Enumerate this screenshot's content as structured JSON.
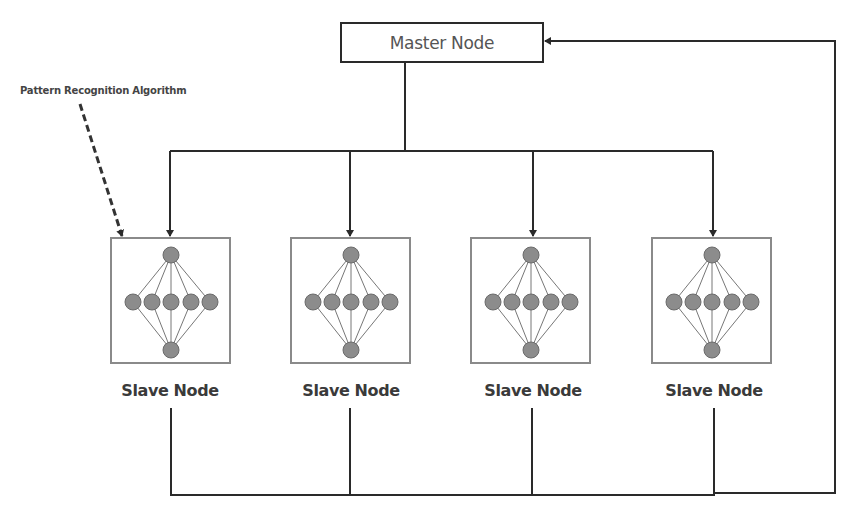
{
  "master": {
    "label": "Master Node"
  },
  "annotation": {
    "label": "Pattern Recognition Algorithm"
  },
  "slaves": [
    {
      "label": "Slave Node"
    },
    {
      "label": "Slave Node"
    },
    {
      "label": "Slave Node"
    },
    {
      "label": "Slave Node"
    }
  ],
  "neural_net": {
    "layers": [
      1,
      5,
      1
    ]
  },
  "colors": {
    "line": "#2a2a2a",
    "node_fill": "#8c8c8c",
    "box_border": "#8a8a8a"
  }
}
